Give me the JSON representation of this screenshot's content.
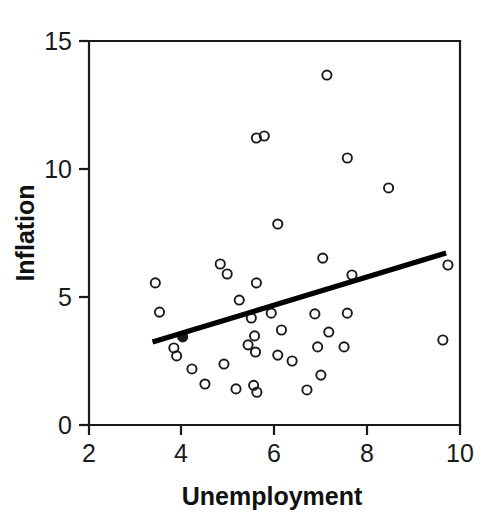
{
  "chart_data": {
    "type": "scatter",
    "title": "",
    "xlabel": "Unemployment",
    "ylabel": "Inflation",
    "xlim": [
      2,
      10
    ],
    "ylim": [
      0,
      15
    ],
    "xticks": [
      2,
      4,
      6,
      8,
      10
    ],
    "yticks": [
      0,
      5,
      10,
      15
    ],
    "xtick_labels": [
      "2",
      "4",
      "6",
      "8",
      "10"
    ],
    "ytick_labels": [
      "0",
      "5",
      "10",
      "15"
    ],
    "grid": false,
    "legend": null,
    "marker": "open-circle",
    "marker_color": "#1a1a1a",
    "points": [
      {
        "x": 3.43,
        "y": 5.55
      },
      {
        "x": 3.52,
        "y": 4.41
      },
      {
        "x": 3.83,
        "y": 3.01
      },
      {
        "x": 3.89,
        "y": 2.7
      },
      {
        "x": 4.02,
        "y": 3.44,
        "filled": true
      },
      {
        "x": 4.22,
        "y": 2.19
      },
      {
        "x": 4.5,
        "y": 1.6
      },
      {
        "x": 4.83,
        "y": 6.29
      },
      {
        "x": 4.91,
        "y": 2.38
      },
      {
        "x": 4.98,
        "y": 5.9
      },
      {
        "x": 5.17,
        "y": 1.41
      },
      {
        "x": 5.24,
        "y": 4.88
      },
      {
        "x": 5.43,
        "y": 3.13
      },
      {
        "x": 5.5,
        "y": 4.18
      },
      {
        "x": 5.57,
        "y": 3.48
      },
      {
        "x": 5.59,
        "y": 2.85
      },
      {
        "x": 5.61,
        "y": 11.21
      },
      {
        "x": 5.61,
        "y": 5.55
      },
      {
        "x": 5.55,
        "y": 1.55
      },
      {
        "x": 5.62,
        "y": 1.28
      },
      {
        "x": 5.78,
        "y": 11.29
      },
      {
        "x": 5.93,
        "y": 4.37
      },
      {
        "x": 6.07,
        "y": 7.85
      },
      {
        "x": 6.07,
        "y": 2.73
      },
      {
        "x": 6.15,
        "y": 3.71
      },
      {
        "x": 6.38,
        "y": 2.5
      },
      {
        "x": 6.7,
        "y": 1.37
      },
      {
        "x": 6.87,
        "y": 4.34
      },
      {
        "x": 6.93,
        "y": 3.05
      },
      {
        "x": 7.0,
        "y": 1.95
      },
      {
        "x": 7.04,
        "y": 6.52
      },
      {
        "x": 7.13,
        "y": 13.67
      },
      {
        "x": 7.17,
        "y": 3.63
      },
      {
        "x": 7.5,
        "y": 3.05
      },
      {
        "x": 7.57,
        "y": 10.43
      },
      {
        "x": 7.57,
        "y": 4.37
      },
      {
        "x": 7.67,
        "y": 5.86
      },
      {
        "x": 8.46,
        "y": 9.26
      },
      {
        "x": 9.63,
        "y": 3.32
      },
      {
        "x": 9.74,
        "y": 6.25
      }
    ],
    "trend_line": {
      "x_start": 3.37,
      "y_start": 3.24,
      "x_end": 9.7,
      "y_end": 6.72,
      "color": "#000000",
      "description": "positive linear fit"
    }
  }
}
